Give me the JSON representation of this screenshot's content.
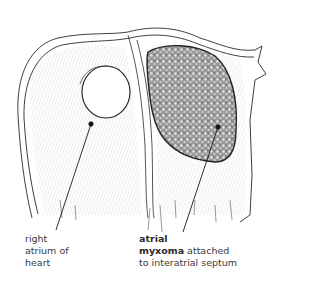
{
  "figure": {
    "style": "black-and-white anatomical line drawing"
  },
  "labels": {
    "right_atrium": {
      "line1": "right",
      "line2": "atrium of",
      "line3": "heart"
    },
    "myxoma": {
      "line1_bold": "atrial",
      "line2_bold": "myxoma",
      "line2_rest": " attached",
      "line3": "to interatrial septum"
    }
  },
  "markers": [
    {
      "name": "right-atrium-marker",
      "x": 91,
      "y": 124
    },
    {
      "name": "myxoma-marker",
      "x": 218,
      "y": 127
    }
  ],
  "colors": {
    "ink": "#2a2a2a",
    "background": "#ffffff",
    "tumor_fill": "#8a8a8a"
  }
}
